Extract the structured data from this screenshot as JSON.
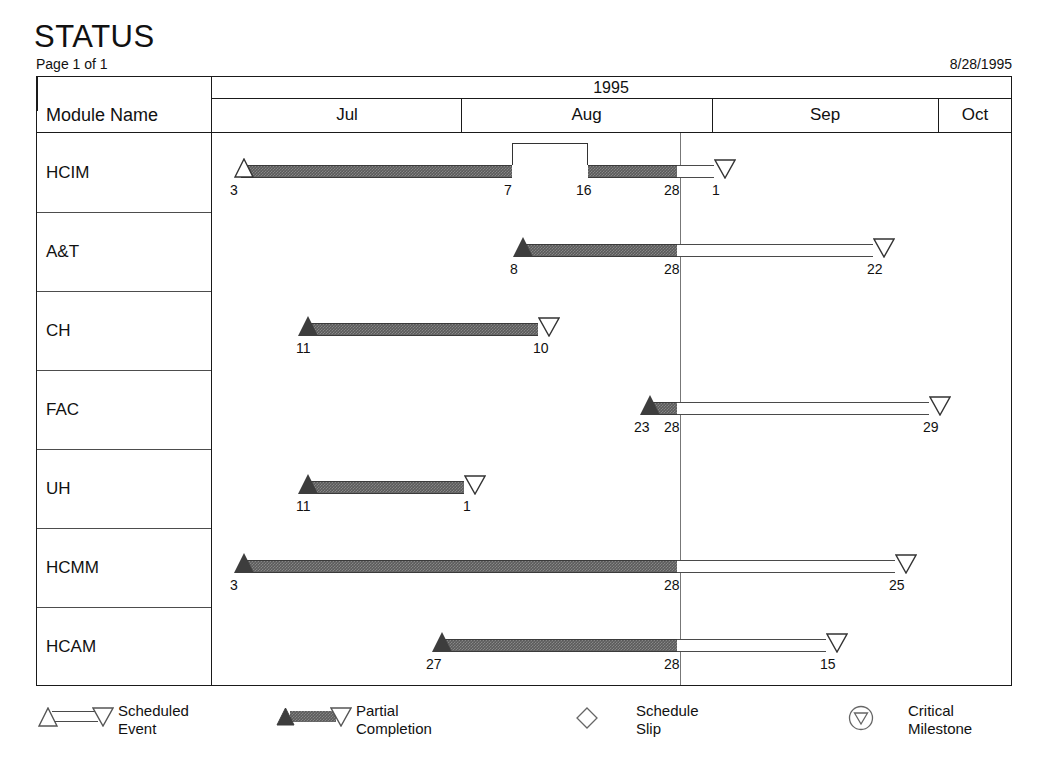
{
  "header": {
    "title": "STATUS",
    "page_label": "Page 1 of 1",
    "report_date": "8/28/1995"
  },
  "table": {
    "module_name_header": "Module Name",
    "year_label": "1995"
  },
  "chart_data": {
    "type": "gantt",
    "title": "STATUS",
    "year": "1995",
    "status_date": "8/28/1995",
    "months": [
      {
        "label": "Jul",
        "x_start": 232,
        "x_end": 460
      },
      {
        "label": "Aug",
        "x_start": 460,
        "x_end": 711
      },
      {
        "label": "Sep",
        "x_start": 711,
        "x_end": 937
      },
      {
        "label": "Oct",
        "x_start": 937,
        "x_end": 1011
      }
    ],
    "status_line_x": 679,
    "axis_x_min": 210,
    "axis_x_max": 1011,
    "rows": [
      {
        "module": "HCIM",
        "segments": [
          {
            "kind": "solid",
            "x_start": 240,
            "x_end": 511
          },
          {
            "kind": "solid",
            "x_start": 587,
            "x_end": 676
          },
          {
            "kind": "hollow",
            "x_start": 676,
            "x_end": 713
          }
        ],
        "bridge": {
          "x_start": 511,
          "x_end": 587,
          "height": 22
        },
        "start_marker": {
          "type": "triangle-up",
          "fill": "hollow",
          "x": 233
        },
        "end_marker": {
          "type": "triangle-down",
          "fill": "hollow",
          "x": 713
        },
        "date_labels": [
          {
            "text": "3",
            "x": 229
          },
          {
            "text": "7",
            "x": 503
          },
          {
            "text": "16",
            "x": 575
          },
          {
            "text": "28",
            "x": 663
          },
          {
            "text": "1",
            "x": 711
          }
        ]
      },
      {
        "module": "A&T",
        "segments": [
          {
            "kind": "solid",
            "x_start": 519,
            "x_end": 676
          },
          {
            "kind": "hollow",
            "x_start": 676,
            "x_end": 872
          }
        ],
        "bridge": null,
        "start_marker": {
          "type": "triangle-up",
          "fill": "filled",
          "x": 512
        },
        "end_marker": {
          "type": "triangle-down",
          "fill": "hollow",
          "x": 872
        },
        "date_labels": [
          {
            "text": "8",
            "x": 509
          },
          {
            "text": "28",
            "x": 663
          },
          {
            "text": "22",
            "x": 866
          }
        ]
      },
      {
        "module": "CH",
        "segments": [
          {
            "kind": "solid",
            "x_start": 305,
            "x_end": 537
          }
        ],
        "bridge": null,
        "start_marker": {
          "type": "triangle-up",
          "fill": "filled",
          "x": 297
        },
        "end_marker": {
          "type": "triangle-down",
          "fill": "hollow",
          "x": 537
        },
        "date_labels": [
          {
            "text": "11",
            "x": 295
          },
          {
            "text": "10",
            "x": 532
          }
        ]
      },
      {
        "module": "FAC",
        "segments": [
          {
            "kind": "solid",
            "x_start": 646,
            "x_end": 676
          },
          {
            "kind": "hollow",
            "x_start": 676,
            "x_end": 928
          }
        ],
        "bridge": null,
        "start_marker": {
          "type": "triangle-up",
          "fill": "filled",
          "x": 639
        },
        "end_marker": {
          "type": "triangle-down",
          "fill": "hollow",
          "x": 928
        },
        "date_labels": [
          {
            "text": "23",
            "x": 633
          },
          {
            "text": "28",
            "x": 663
          },
          {
            "text": "29",
            "x": 922
          }
        ]
      },
      {
        "module": "UH",
        "segments": [
          {
            "kind": "solid",
            "x_start": 305,
            "x_end": 463
          }
        ],
        "bridge": null,
        "start_marker": {
          "type": "triangle-up",
          "fill": "filled",
          "x": 297
        },
        "end_marker": {
          "type": "triangle-down",
          "fill": "hollow",
          "x": 463
        },
        "date_labels": [
          {
            "text": "11",
            "x": 295
          },
          {
            "text": "1",
            "x": 462
          }
        ]
      },
      {
        "module": "HCMM",
        "segments": [
          {
            "kind": "solid",
            "x_start": 240,
            "x_end": 676
          },
          {
            "kind": "hollow",
            "x_start": 676,
            "x_end": 894
          }
        ],
        "bridge": null,
        "start_marker": {
          "type": "triangle-up",
          "fill": "filled",
          "x": 233
        },
        "end_marker": {
          "type": "triangle-down",
          "fill": "hollow",
          "x": 894
        },
        "date_labels": [
          {
            "text": "3",
            "x": 229
          },
          {
            "text": "28",
            "x": 663
          },
          {
            "text": "25",
            "x": 888
          }
        ]
      },
      {
        "module": "HCAM",
        "segments": [
          {
            "kind": "solid",
            "x_start": 438,
            "x_end": 676
          },
          {
            "kind": "hollow",
            "x_start": 676,
            "x_end": 825
          }
        ],
        "bridge": null,
        "start_marker": {
          "type": "triangle-up",
          "fill": "filled",
          "x": 431
        },
        "end_marker": {
          "type": "triangle-down",
          "fill": "hollow",
          "x": 825
        },
        "date_labels": [
          {
            "text": "27",
            "x": 425
          },
          {
            "text": "28",
            "x": 663
          },
          {
            "text": "15",
            "x": 819
          }
        ]
      }
    ],
    "legend": [
      {
        "glyph": "scheduled-event",
        "label": "Scheduled\nEvent"
      },
      {
        "glyph": "partial-completion",
        "label": "Partial\nCompletion"
      },
      {
        "glyph": "schedule-slip",
        "label": "Schedule\nSlip"
      },
      {
        "glyph": "critical-milestone",
        "label": "Critical\nMilestone"
      }
    ]
  },
  "colors": {
    "bar_fill": "#5b5b5b",
    "bar_outline": "#3a3a3a",
    "frame": "#1a1a1a",
    "status_line": "#777777",
    "background": "#ffffff"
  }
}
